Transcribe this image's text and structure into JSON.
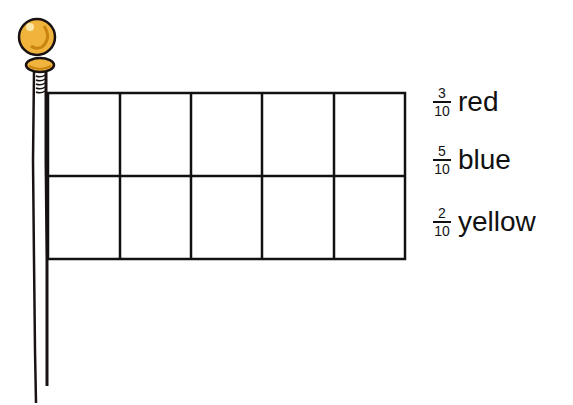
{
  "flag": {
    "rows": 2,
    "columns": 5,
    "total_parts": 10,
    "fill_color": "#ffffff",
    "line_color": "#111111"
  },
  "pole": {
    "finial_color": "#f0b43c",
    "finial_highlight": "#fde7a8",
    "finial_shadow": "#c98412"
  },
  "legend": [
    {
      "numerator": "3",
      "denominator": "10",
      "label": "red"
    },
    {
      "numerator": "5",
      "denominator": "10",
      "label": "blue"
    },
    {
      "numerator": "2",
      "denominator": "10",
      "label": "yellow"
    }
  ]
}
